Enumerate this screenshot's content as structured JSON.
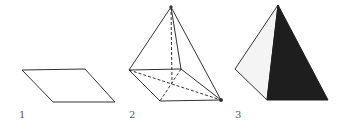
{
  "figures": [
    {
      "label": "1",
      "description": "parallelogram base"
    },
    {
      "label": "2",
      "description": "pyramid wireframe with hidden edges dashed"
    },
    {
      "label": "3",
      "description": "solid pyramid with shaded face"
    }
  ],
  "colors": {
    "stroke": "#333333",
    "dark_face": "#1e1e1e",
    "light_face": "#f4f4f4"
  }
}
